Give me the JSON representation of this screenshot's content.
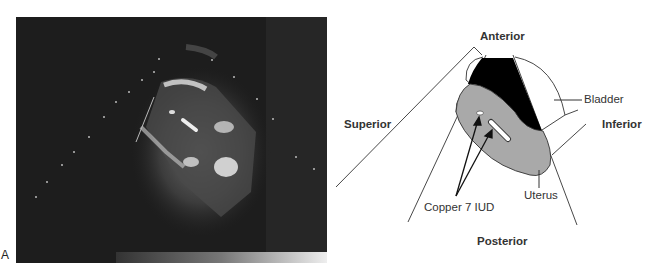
{
  "figure": {
    "panel_label": "A",
    "ultrasound_image": {
      "description": "Transvaginal/pelvic ultrasound image showing uterus with Copper 7 IUD echoes"
    },
    "diagram": {
      "orientation_labels": {
        "top": "Anterior",
        "left": "Superior",
        "right": "Inferior",
        "bottom": "Posterior"
      },
      "structure_labels": {
        "bladder": "Bladder",
        "uterus": "Uterus",
        "iud": "Copper 7 IUD"
      },
      "colors": {
        "bladder_fill": "#000000",
        "uterus_fill": "#a8a8a8",
        "line": "#333333"
      }
    }
  }
}
